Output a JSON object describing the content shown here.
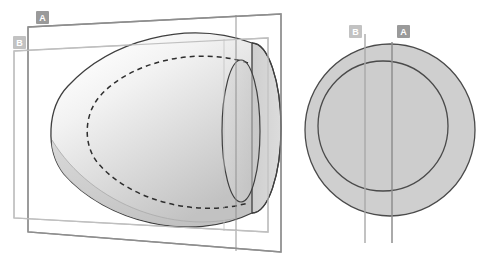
{
  "figure": {
    "background_color": "#ffffff"
  },
  "labels": {
    "plane_a": "A",
    "plane_b": "B",
    "section_a": "A",
    "section_b": "B"
  },
  "colors": {
    "outline_dark": "#3f3f3f",
    "outline_mid": "#555555",
    "plane_a_stroke": "#8e8e8e",
    "plane_b_stroke": "#bcbcbc",
    "section_fill": "#cfcfcf",
    "section_stroke": "#4a4a4a",
    "line_a_stroke": "#8e8e8e",
    "line_b_stroke": "#a8a8a8",
    "badge_a_fill": "#9a9a9a",
    "badge_b_fill": "#c2c2c2",
    "badge_text": "#ffffff",
    "body_light": "#fcfcfc",
    "body_mid": "#e2e2e2",
    "body_shadow": "#c6c6c6",
    "rim_fill": "#c4c4c4",
    "dashed_stroke": "#2e2e2e"
  },
  "left_view": {
    "name": "perspective-view",
    "plane_a": {
      "label": "A",
      "corners": "28,27 281,14 281,252 28,232",
      "badge": {
        "x": 36,
        "y": 11,
        "w": 13,
        "h": 13
      }
    },
    "plane_b": {
      "label": "B",
      "corners": "14,51 268,38 268,232 14,218",
      "badge": {
        "x": 13,
        "y": 36,
        "w": 13,
        "h": 13
      }
    },
    "body": {
      "name": "paraboloid-shell",
      "apex_x": 47,
      "rim_center_x": 250,
      "rim_center_y": 128,
      "rim_rx": 28,
      "rim_ry": 84
    },
    "inner_dashed": {
      "name": "hidden-inner-contour",
      "dash_pattern": "5,4"
    }
  },
  "right_view": {
    "name": "axial-cross-section-view",
    "outer_circle": {
      "cx": 390,
      "cy": 130,
      "rx": 85,
      "ry": 86
    },
    "inner_circle": {
      "cx": 383,
      "cy": 126,
      "rx": 65,
      "ry": 65
    },
    "line_a": {
      "label": "A",
      "x": 392,
      "y1": 42,
      "y2": 243,
      "badge": {
        "x": 397,
        "y": 25,
        "w": 13,
        "h": 13
      }
    },
    "line_b": {
      "label": "B",
      "x": 365,
      "y1": 34,
      "y2": 243,
      "badge": {
        "x": 349,
        "y": 25,
        "w": 13,
        "h": 13
      }
    }
  }
}
